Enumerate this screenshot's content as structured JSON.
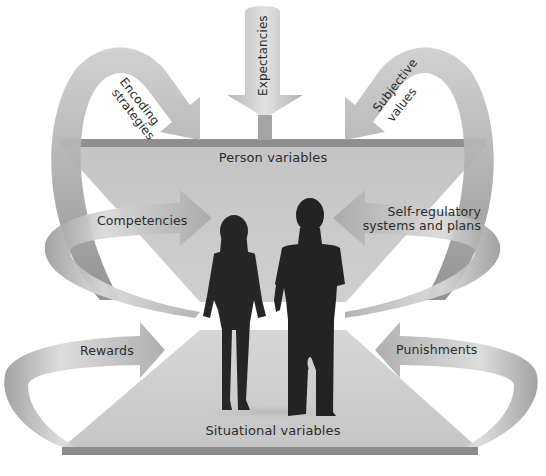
{
  "diagram": {
    "colors": {
      "background": "#ffffff",
      "panel_fill": "#c9c9c9",
      "ledge_dark": "#8e8e8e",
      "arrow_light": "#d8d8d8",
      "arrow_mid": "#a9a9a9",
      "arrow_dark": "#8a8a8a",
      "silhouette": "#262626",
      "text": "#2b2b2b"
    },
    "person_panel": {
      "label": "Person variables"
    },
    "situation_panel": {
      "label": "Situational variables"
    },
    "person_arrows": [
      {
        "id": "encoding",
        "label_line1": "Encoding",
        "label_line2": "strategies",
        "direction": "down-right"
      },
      {
        "id": "expectancies",
        "label": "Expectancies",
        "direction": "down"
      },
      {
        "id": "subjective",
        "label_line1": "Subjective",
        "label_line2": "values",
        "direction": "down-left"
      },
      {
        "id": "competencies",
        "label": "Competencies",
        "direction": "right"
      },
      {
        "id": "selfreg",
        "label_line1": "Self-regulatory",
        "label_line2": "systems and plans",
        "direction": "left"
      }
    ],
    "situation_arrows": [
      {
        "id": "rewards",
        "label": "Rewards",
        "direction": "right"
      },
      {
        "id": "punishments",
        "label": "Punishments",
        "direction": "left"
      }
    ],
    "figures": [
      {
        "id": "woman",
        "description": "silhouette of a woman walking"
      },
      {
        "id": "man",
        "description": "silhouette of a man walking"
      }
    ]
  }
}
